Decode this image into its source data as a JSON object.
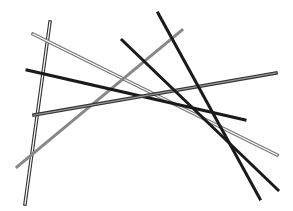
{
  "canvas": {
    "width": 293,
    "height": 211,
    "background": "#ffffff"
  },
  "lines": [
    {
      "id": "double-vertical",
      "x1": 50,
      "y1": 22,
      "x2": 25,
      "y2": 204,
      "style": "double",
      "outer": "#333333",
      "inner": "#ffffff",
      "width": 3.5
    },
    {
      "id": "double-light",
      "x1": 33,
      "y1": 34,
      "x2": 277,
      "y2": 155,
      "style": "double",
      "outer": "#777777",
      "inner": "#ffffff",
      "width": 3.5
    },
    {
      "id": "gray-solid",
      "x1": 17,
      "y1": 167,
      "x2": 182,
      "y2": 30,
      "style": "solid",
      "color": "#888888",
      "width": 3
    },
    {
      "id": "black-long",
      "x1": 27,
      "y1": 70,
      "x2": 245,
      "y2": 120,
      "style": "solid",
      "color": "#1a1a1a",
      "width": 3
    },
    {
      "id": "double-dark",
      "x1": 34,
      "y1": 115,
      "x2": 276,
      "y2": 73,
      "style": "double",
      "outer": "#333333",
      "inner": "#999999",
      "width": 3.5
    },
    {
      "id": "black-diagonal-1",
      "x1": 122,
      "y1": 40,
      "x2": 278,
      "y2": 190,
      "style": "solid",
      "color": "#1a1a1a",
      "width": 3
    },
    {
      "id": "black-diagonal-2",
      "x1": 158,
      "y1": 13,
      "x2": 260,
      "y2": 199,
      "style": "solid",
      "color": "#1a1a1a",
      "width": 3
    }
  ]
}
